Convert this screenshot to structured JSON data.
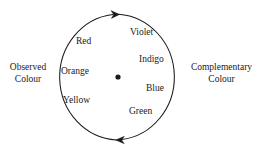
{
  "figure": {
    "background_color": "#ffffff",
    "stroke_color": "#1a1a1a",
    "text_color": "#1a1a1a"
  },
  "diagram": {
    "type": "colour-wheel",
    "circle": {
      "center_x": 118,
      "center_y": 77,
      "radius_x": 60,
      "radius_y": 63
    },
    "center_dot": {
      "x": 118,
      "y": 77,
      "radius": 2.6
    },
    "rotation_direction": "clockwise",
    "arrows": [
      {
        "name": "top-arrow",
        "x": 114,
        "y": 14,
        "direction": "right"
      },
      {
        "name": "bottom-arrow",
        "x": 121,
        "y": 140,
        "direction": "left"
      }
    ]
  },
  "labels": {
    "left": {
      "line1": "Observed",
      "line2": "Colour"
    },
    "right": {
      "line1": "Complementary",
      "line2": "Colour"
    }
  },
  "spectrum": [
    {
      "name": "red",
      "text": "Red",
      "x": 76,
      "y": 36,
      "side": "observed"
    },
    {
      "name": "orange",
      "text": "Orange",
      "x": 61,
      "y": 66,
      "side": "observed"
    },
    {
      "name": "yellow",
      "text": "Yellow",
      "x": 63,
      "y": 95,
      "side": "observed"
    },
    {
      "name": "violet",
      "text": "Violet",
      "x": 130,
      "y": 27,
      "side": "complementary"
    },
    {
      "name": "indigo",
      "text": "Indigo",
      "x": 139,
      "y": 54,
      "side": "complementary"
    },
    {
      "name": "blue",
      "text": "Blue",
      "x": 146,
      "y": 83,
      "side": "complementary"
    },
    {
      "name": "green",
      "text": "Green",
      "x": 129,
      "y": 106,
      "side": "complementary"
    }
  ]
}
